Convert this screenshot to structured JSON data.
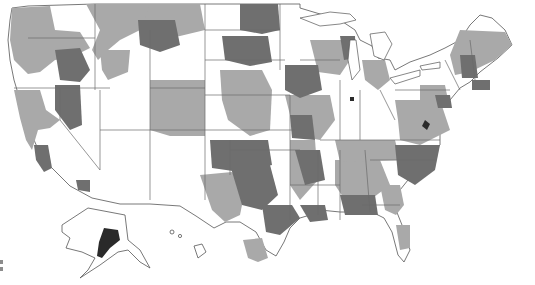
{
  "map": {
    "title": "",
    "subject": "United States choropleth map (regional shading)",
    "shading_levels": [
      {
        "name": "none",
        "color": "#ffffff"
      },
      {
        "name": "low",
        "color": "#a9a9a9"
      },
      {
        "name": "medium",
        "color": "#7a7a7a"
      },
      {
        "name": "high",
        "color": "#2a2a2a"
      }
    ],
    "legend": {
      "visible_labels": [],
      "swatch_colors": [
        "#8c8c8c",
        "#8c8c8c"
      ]
    }
  }
}
